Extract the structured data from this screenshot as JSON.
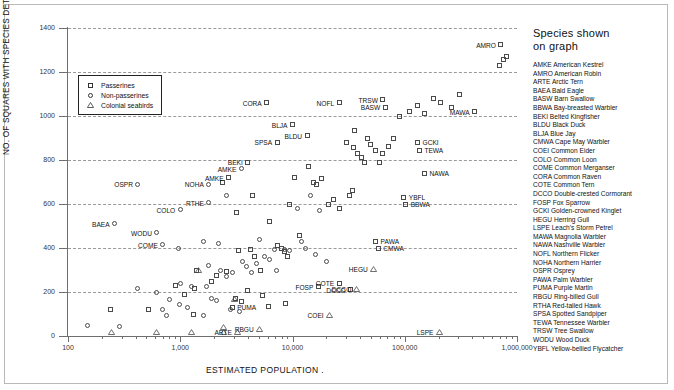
{
  "chart_data": {
    "type": "scatter",
    "title": "",
    "xlabel": "ESTIMATED POPULATION    .",
    "ylabel": "NO. OF SQUARES WITH SPECIES DETECTED",
    "xscale": "log",
    "xlim": [
      100,
      1000000
    ],
    "ylim": [
      0,
      1400
    ],
    "ytick_labels": [
      "0",
      "200",
      "400",
      "600",
      "800",
      "1000",
      "1200",
      "1400"
    ],
    "ytick_values": [
      0,
      200,
      400,
      600,
      800,
      1000,
      1200,
      1400
    ],
    "xtick_labels": [
      "100",
      "1,000",
      "10,000",
      "100,000",
      "1,000,000"
    ],
    "xtick_values": [
      100,
      1000,
      10000,
      100000,
      1000000
    ],
    "grid": "horizontal-dashed",
    "legend_position": "upper-left-inside",
    "legend": [
      {
        "marker": "square",
        "label": "Passerines"
      },
      {
        "marker": "circle",
        "label": "Non-passerines"
      },
      {
        "marker": "triangle",
        "label": "Colonial seabirds"
      }
    ],
    "series": [
      {
        "name": "Passerines",
        "marker": "square",
        "points": [
          {
            "x": 1400,
            "y": 300,
            "label": ""
          },
          {
            "x": 900,
            "y": 230,
            "label": ""
          },
          {
            "x": 1100,
            "y": 190,
            "label": ""
          },
          {
            "x": 1350,
            "y": 215,
            "label": ""
          },
          {
            "x": 1900,
            "y": 250,
            "label": ""
          },
          {
            "x": 2100,
            "y": 275,
            "label": ""
          },
          {
            "x": 2600,
            "y": 295,
            "label": ""
          },
          {
            "x": 240,
            "y": 120,
            "label": ""
          },
          {
            "x": 520,
            "y": 120,
            "label": ""
          },
          {
            "x": 1300,
            "y": 100,
            "label": ""
          },
          {
            "x": 3100,
            "y": 170,
            "label": ""
          },
          {
            "x": 3500,
            "y": 155,
            "label": ""
          },
          {
            "x": 3300,
            "y": 390,
            "label": ""
          },
          {
            "x": 4200,
            "y": 395,
            "label": ""
          },
          {
            "x": 4600,
            "y": 360,
            "label": ""
          },
          {
            "x": 5200,
            "y": 300,
            "label": ""
          },
          {
            "x": 4000,
            "y": 205,
            "label": ""
          },
          {
            "x": 5400,
            "y": 185,
            "label": ""
          },
          {
            "x": 6100,
            "y": 135,
            "label": ""
          },
          {
            "x": 7400,
            "y": 410,
            "label": ""
          },
          {
            "x": 7900,
            "y": 400,
            "label": ""
          },
          {
            "x": 8400,
            "y": 385,
            "label": ""
          },
          {
            "x": 9000,
            "y": 360,
            "label": ""
          },
          {
            "x": 8600,
            "y": 150,
            "label": ""
          },
          {
            "x": 9500,
            "y": 600,
            "label": ""
          },
          {
            "x": 10500,
            "y": 720,
            "label": ""
          },
          {
            "x": 11500,
            "y": 455,
            "label": ""
          },
          {
            "x": 6200,
            "y": 520,
            "label": ""
          },
          {
            "x": 4400,
            "y": 640,
            "label": ""
          },
          {
            "x": 3200,
            "y": 560,
            "label": ""
          },
          {
            "x": 2400,
            "y": 700,
            "label": ""
          },
          {
            "x": 14000,
            "y": 770,
            "label": ""
          },
          {
            "x": 15500,
            "y": 700,
            "label": ""
          },
          {
            "x": 16500,
            "y": 690,
            "label": ""
          },
          {
            "x": 18000,
            "y": 715,
            "label": ""
          },
          {
            "x": 21000,
            "y": 600,
            "label": ""
          },
          {
            "x": 23000,
            "y": 620,
            "label": ""
          },
          {
            "x": 26000,
            "y": 580,
            "label": ""
          },
          {
            "x": 32000,
            "y": 640,
            "label": ""
          },
          {
            "x": 34000,
            "y": 660,
            "label": ""
          },
          {
            "x": 30000,
            "y": 880,
            "label": ""
          },
          {
            "x": 35000,
            "y": 855,
            "label": ""
          },
          {
            "x": 38000,
            "y": 830,
            "label": ""
          },
          {
            "x": 41000,
            "y": 810,
            "label": ""
          },
          {
            "x": 44000,
            "y": 790,
            "label": ""
          },
          {
            "x": 36000,
            "y": 935,
            "label": ""
          },
          {
            "x": 47000,
            "y": 900,
            "label": ""
          },
          {
            "x": 50000,
            "y": 870,
            "label": ""
          },
          {
            "x": 55000,
            "y": 845,
            "label": ""
          },
          {
            "x": 60000,
            "y": 790,
            "label": ""
          },
          {
            "x": 64000,
            "y": 830,
            "label": ""
          },
          {
            "x": 72000,
            "y": 860,
            "label": ""
          },
          {
            "x": 80000,
            "y": 900,
            "label": ""
          },
          {
            "x": 90000,
            "y": 1000,
            "label": ""
          },
          {
            "x": 110000,
            "y": 1020,
            "label": ""
          },
          {
            "x": 130000,
            "y": 1050,
            "label": ""
          },
          {
            "x": 150000,
            "y": 1010,
            "label": ""
          },
          {
            "x": 180000,
            "y": 1080,
            "label": ""
          },
          {
            "x": 210000,
            "y": 1060,
            "label": ""
          },
          {
            "x": 260000,
            "y": 1040,
            "label": ""
          },
          {
            "x": 310000,
            "y": 1100,
            "label": ""
          },
          {
            "x": 700000,
            "y": 1230,
            "label": ""
          },
          {
            "x": 760000,
            "y": 1255,
            "label": ""
          },
          {
            "x": 800000,
            "y": 1270,
            "label": ""
          },
          {
            "x": 26000,
            "y": 1060,
            "side": "right",
            "label": "NOFL"
          },
          {
            "x": 5900,
            "y": 1060,
            "side": "right",
            "label": "CORA"
          },
          {
            "x": 10000,
            "y": 960,
            "side": "right",
            "label": "BLJA"
          },
          {
            "x": 64000,
            "y": 1075,
            "side": "right",
            "label": "TRSW"
          },
          {
            "x": 67000,
            "y": 1040,
            "side": "right",
            "label": "BASW"
          },
          {
            "x": 720000,
            "y": 1325,
            "side": "right",
            "label": "AMRO"
          },
          {
            "x": 420000,
            "y": 1020,
            "side": "right",
            "label": "MAWA"
          },
          {
            "x": 130000,
            "y": 880,
            "side": "left",
            "label": "GCKI"
          },
          {
            "x": 135000,
            "y": 845,
            "side": "left",
            "label": "TEWA"
          },
          {
            "x": 150000,
            "y": 740,
            "side": "left",
            "label": "NAWA"
          },
          {
            "x": 98000,
            "y": 630,
            "side": "left",
            "label": "YBFL"
          },
          {
            "x": 102000,
            "y": 600,
            "side": "left",
            "label": "BBWA"
          },
          {
            "x": 55000,
            "y": 430,
            "side": "left",
            "label": "PAWA"
          },
          {
            "x": 58000,
            "y": 400,
            "side": "left",
            "label": "CMWA"
          },
          {
            "x": 7300,
            "y": 880,
            "side": "right",
            "label": "SPSA"
          },
          {
            "x": 4000,
            "y": 790,
            "side": "right",
            "label": "BEKI"
          },
          {
            "x": 13500,
            "y": 910,
            "side": "right",
            "label": "BLDU"
          },
          {
            "x": 2700,
            "y": 720,
            "side": "right",
            "label": "AMKE"
          },
          {
            "x": 17000,
            "y": 225,
            "side": "right",
            "label": "FOSP"
          },
          {
            "x": 26000,
            "y": 240,
            "side": "right",
            "label": "COTE"
          },
          {
            "x": 33000,
            "y": 210,
            "side": "right",
            "label": "DCCO"
          },
          {
            "x": 2900,
            "y": 130,
            "side": "left",
            "label": "PUMA"
          }
        ]
      },
      {
        "name": "Non-passerines",
        "marker": "circle",
        "points": [
          {
            "x": 150,
            "y": 50,
            "label": ""
          },
          {
            "x": 290,
            "y": 45,
            "label": ""
          },
          {
            "x": 700,
            "y": 120,
            "label": ""
          },
          {
            "x": 760,
            "y": 95,
            "label": ""
          },
          {
            "x": 800,
            "y": 165,
            "label": ""
          },
          {
            "x": 980,
            "y": 145,
            "label": ""
          },
          {
            "x": 1150,
            "y": 130,
            "label": ""
          },
          {
            "x": 1600,
            "y": 95,
            "label": ""
          },
          {
            "x": 1900,
            "y": 170,
            "label": ""
          },
          {
            "x": 2100,
            "y": 160,
            "label": ""
          },
          {
            "x": 2300,
            "y": 300,
            "label": ""
          },
          {
            "x": 2600,
            "y": 270,
            "label": ""
          },
          {
            "x": 2900,
            "y": 290,
            "label": ""
          },
          {
            "x": 1800,
            "y": 320,
            "label": ""
          },
          {
            "x": 3600,
            "y": 340,
            "label": ""
          },
          {
            "x": 3900,
            "y": 315,
            "label": ""
          },
          {
            "x": 4300,
            "y": 290,
            "label": ""
          },
          {
            "x": 2800,
            "y": 120,
            "label": ""
          },
          {
            "x": 3400,
            "y": 110,
            "label": ""
          },
          {
            "x": 4800,
            "y": 330,
            "label": ""
          },
          {
            "x": 5600,
            "y": 360,
            "label": ""
          },
          {
            "x": 6300,
            "y": 350,
            "label": ""
          },
          {
            "x": 6900,
            "y": 395,
            "label": ""
          },
          {
            "x": 5100,
            "y": 440,
            "label": ""
          },
          {
            "x": 7200,
            "y": 300,
            "label": ""
          },
          {
            "x": 8500,
            "y": 395,
            "label": ""
          },
          {
            "x": 9500,
            "y": 390,
            "label": ""
          },
          {
            "x": 12000,
            "y": 430,
            "label": ""
          },
          {
            "x": 13000,
            "y": 400,
            "label": ""
          },
          {
            "x": 16000,
            "y": 370,
            "label": ""
          },
          {
            "x": 20000,
            "y": 340,
            "label": ""
          },
          {
            "x": 11000,
            "y": 580,
            "label": ""
          },
          {
            "x": 14500,
            "y": 640,
            "label": ""
          },
          {
            "x": 17500,
            "y": 570,
            "label": ""
          },
          {
            "x": 1000,
            "y": 240,
            "label": ""
          },
          {
            "x": 1250,
            "y": 225,
            "label": ""
          },
          {
            "x": 1700,
            "y": 225,
            "label": ""
          },
          {
            "x": 420,
            "y": 215,
            "label": ""
          },
          {
            "x": 620,
            "y": 200,
            "label": ""
          },
          {
            "x": 960,
            "y": 400,
            "label": ""
          },
          {
            "x": 1600,
            "y": 430,
            "label": ""
          },
          {
            "x": 2200,
            "y": 420,
            "label": ""
          },
          {
            "x": 2600,
            "y": 640,
            "label": ""
          },
          {
            "x": 260,
            "y": 510,
            "side": "right",
            "label": "BAEA"
          },
          {
            "x": 620,
            "y": 470,
            "side": "right",
            "label": "WODU"
          },
          {
            "x": 420,
            "y": 690,
            "side": "right",
            "label": "OSPR"
          },
          {
            "x": 1800,
            "y": 690,
            "side": "right",
            "label": "NOHA"
          },
          {
            "x": 1000,
            "y": 575,
            "side": "right",
            "label": "COLO"
          },
          {
            "x": 1800,
            "y": 605,
            "side": "right",
            "label": "RTHE"
          },
          {
            "x": 700,
            "y": 415,
            "side": "right",
            "label": "COME"
          },
          {
            "x": 3500,
            "y": 760,
            "side": "right",
            "label": "AMKE"
          }
        ]
      },
      {
        "name": "Colonial seabirds",
        "marker": "triangle",
        "points": [
          {
            "x": 240,
            "y": 18,
            "label": ""
          },
          {
            "x": 610,
            "y": 18,
            "label": ""
          },
          {
            "x": 1250,
            "y": 18,
            "label": ""
          },
          {
            "x": 2400,
            "y": 18,
            "label": ""
          },
          {
            "x": 2400,
            "y": 40,
            "label": ""
          },
          {
            "x": 3000,
            "y": 170,
            "label": ""
          },
          {
            "x": 1450,
            "y": 300,
            "label": ""
          },
          {
            "x": 3200,
            "y": 20,
            "side": "right",
            "label": "ARTE"
          },
          {
            "x": 5000,
            "y": 30,
            "side": "right",
            "label": "RBGU"
          },
          {
            "x": 21000,
            "y": 95,
            "side": "right",
            "label": "COEI"
          },
          {
            "x": 37000,
            "y": 215,
            "side": "right",
            "label": "DCCO"
          },
          {
            "x": 52000,
            "y": 305,
            "side": "right",
            "label": "HEGU"
          },
          {
            "x": 200000,
            "y": 20,
            "side": "right",
            "label": "LSPE"
          }
        ]
      }
    ]
  },
  "species_panel": {
    "title_line1": "Species shown",
    "title_line2": "on graph",
    "entries": [
      "AMKE American Kestrel",
      "AMRO American Robin",
      "ARTE Arctic Tern",
      "BAEA Bald Eagle",
      "BASW Barn Swallow",
      "BBWA Bay-breasted Warbler",
      "BEKI Belted Kingfisher",
      "BLDU Black Duck",
      "BLJA Blue Jay",
      "CMWA Cape May Warbler",
      "COEI Common Eider",
      "COLO Common Loon",
      "COME Common Merganser",
      "CORA Common Raven",
      "COTE Common Tern",
      "DCCO Double-crested Cormorant",
      "FOSP Fox Sparrow",
      "GCKI Golden-crowned Kinglet",
      "HEGU Herring Gull",
      "LSPE Leach's Storm Petrel",
      "MAWA Magnolia Warbler",
      "NAWA Nashville Warbler",
      "NOFL Northern Flicker",
      "NOHA Northern Harrier",
      "OSPR Osprey",
      "PAWA Palm Warbler",
      "PUMA Purple Martin",
      "RBGU Ring-billed Gull",
      "RTHA Red-tailed Hawk",
      "SPSA Spotted Sandpiper",
      "TEWA Tennessee Warbler",
      "TRSW Tree Swallow",
      "WODU Wood Duck",
      "YBFL Yellow-bellied Flycatcher"
    ]
  },
  "colors": {
    "marker_stroke": "#4a4a4a",
    "axis": "#6f6f6f",
    "grid": "#9a9a9a",
    "text": "#111111",
    "frame": "#b9b9b9"
  }
}
